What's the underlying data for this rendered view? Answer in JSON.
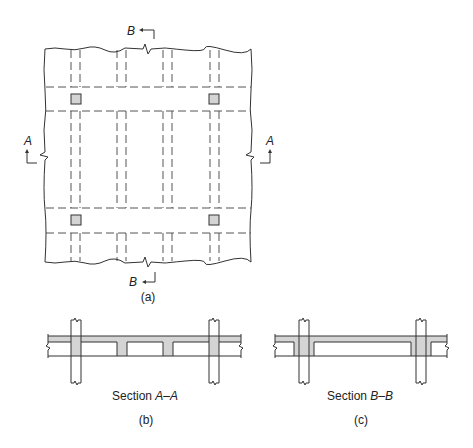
{
  "figure": {
    "plan": {
      "caption": "(a)",
      "section_markers": [
        {
          "id": "top",
          "label": "B"
        },
        {
          "id": "bottom",
          "label": "B"
        },
        {
          "id": "left",
          "label": "A"
        },
        {
          "id": "right",
          "label": "A"
        }
      ],
      "columns": 4,
      "joist_pairs": 4
    },
    "section_aa": {
      "title_prefix": "Section ",
      "title_cut": "A–A",
      "caption": "(b)"
    },
    "section_bb": {
      "title_prefix": "Section ",
      "title_cut": "B–B",
      "caption": "(c)"
    },
    "colors": {
      "concrete_fill": "#d4d4d4",
      "line": "#333333"
    }
  }
}
